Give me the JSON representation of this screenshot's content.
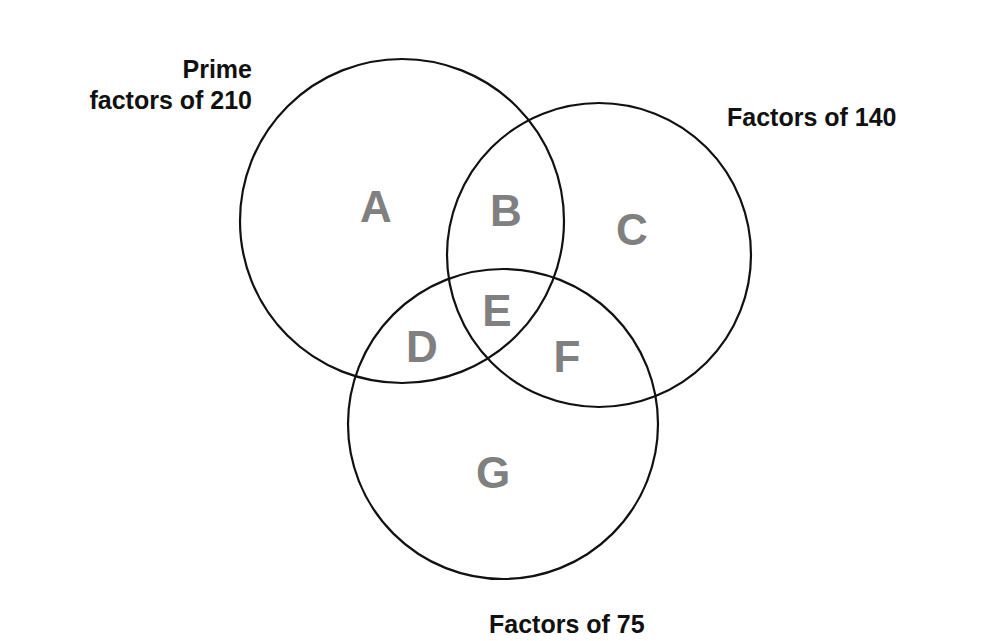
{
  "diagram": {
    "type": "venn",
    "sets": [
      {
        "id": "set-210",
        "label_line1": "Prime",
        "label_line2": "factors of 210",
        "cx": 402,
        "cy": 221,
        "r": 162
      },
      {
        "id": "set-140",
        "label": "Factors of 140",
        "cx": 599,
        "cy": 255,
        "r": 152
      },
      {
        "id": "set-75",
        "label": "Factors of 75",
        "cx": 503,
        "cy": 424,
        "r": 155
      }
    ],
    "regions": [
      {
        "letter": "A",
        "x": 376,
        "y": 222,
        "sets": [
          "Prime factors of 210"
        ]
      },
      {
        "letter": "B",
        "x": 506,
        "y": 226,
        "sets": [
          "Prime factors of 210",
          "Factors of 140"
        ]
      },
      {
        "letter": "C",
        "x": 632,
        "y": 245,
        "sets": [
          "Factors of 140"
        ]
      },
      {
        "letter": "D",
        "x": 422,
        "y": 362,
        "sets": [
          "Prime factors of 210",
          "Factors of 75"
        ]
      },
      {
        "letter": "E",
        "x": 497,
        "y": 326,
        "sets": [
          "Prime factors of 210",
          "Factors of 140",
          "Factors of 75"
        ]
      },
      {
        "letter": "F",
        "x": 567,
        "y": 372,
        "sets": [
          "Factors of 140",
          "Factors of 75"
        ]
      },
      {
        "letter": "G",
        "x": 493,
        "y": 488,
        "sets": [
          "Factors of 75"
        ]
      }
    ]
  }
}
